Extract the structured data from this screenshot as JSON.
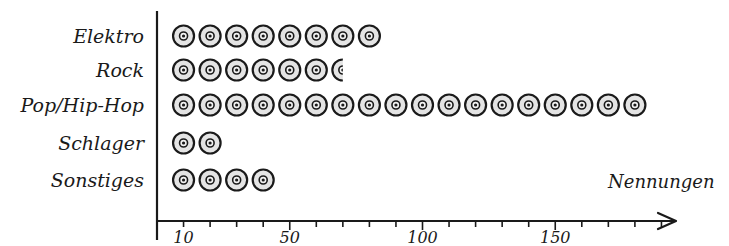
{
  "chart_data": {
    "type": "bar",
    "style": "pictogram",
    "title": "",
    "icon": "cd-disc-icon",
    "unit_per_icon": 10,
    "categories": [
      "Elektro",
      "Rock",
      "Pop/Hip-Hop",
      "Schlager",
      "Sonstiges"
    ],
    "values": [
      80,
      65,
      180,
      20,
      40
    ],
    "xlabel": "Nennungen",
    "ylabel": "",
    "xlim": [
      0,
      195
    ],
    "x_ticks_minor_step": 10,
    "x_tick_labels": [
      {
        "value": 10,
        "label": "10"
      },
      {
        "value": 50,
        "label": "50"
      },
      {
        "value": 100,
        "label": "100"
      },
      {
        "value": 150,
        "label": "150"
      }
    ],
    "grid": false,
    "legend": "none",
    "colors": {
      "disc_fill": "#e4e4e4",
      "stroke": "#1a1a1a",
      "background": "#ffffff"
    }
  }
}
